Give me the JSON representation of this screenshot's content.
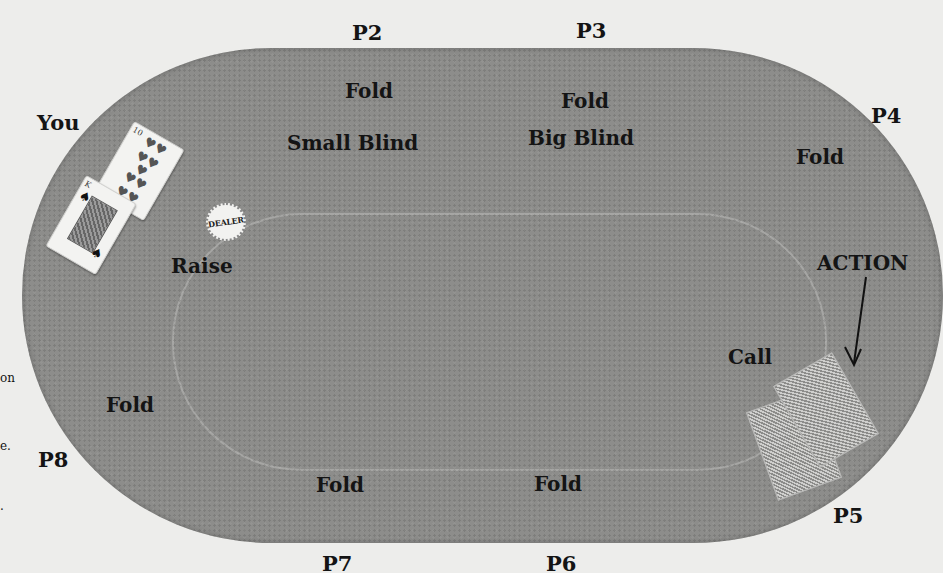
{
  "table": {
    "felt_color": "#8d8d8b",
    "background_color": "#ededeb"
  },
  "seats": {
    "you": {
      "label": "You",
      "action": "Raise"
    },
    "p2": {
      "label": "P2",
      "action": "Fold",
      "role": "Small Blind"
    },
    "p3": {
      "label": "P3",
      "action": "Fold",
      "role": "Big Blind"
    },
    "p4": {
      "label": "P4",
      "action": "Fold"
    },
    "p5": {
      "label": "P5",
      "action": "Call"
    },
    "p6": {
      "label": "P6",
      "action": "Fold"
    },
    "p7": {
      "label": "P7",
      "action": "Fold"
    },
    "p8": {
      "label": "P8",
      "action": "Fold"
    }
  },
  "dealer_button": {
    "label": "DEALER"
  },
  "action_marker": {
    "label": "ACTION"
  },
  "your_cards": [
    {
      "rank": "10",
      "suit": "hearts",
      "suit_glyph": "♥"
    },
    {
      "rank": "K",
      "suit": "spades",
      "suit_glyph": "♠"
    }
  ],
  "left_edge_fragments": [
    "on",
    "e.",
    "."
  ]
}
